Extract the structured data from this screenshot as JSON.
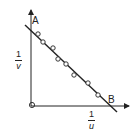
{
  "chart_data": {
    "type": "scatter",
    "title": "",
    "xlabel": "1/u",
    "ylabel": "1/v",
    "points_label_intercepts": {
      "y_intercept": "A",
      "x_intercept": "B"
    },
    "origin_marker": "O",
    "points_px": [
      [
        38,
        34
      ],
      [
        43,
        42
      ],
      [
        53,
        48
      ],
      [
        58,
        59
      ],
      [
        66,
        64
      ],
      [
        74,
        75
      ],
      [
        88,
        83
      ],
      [
        98,
        95
      ]
    ],
    "fit_line_px": [
      [
        25,
        25
      ],
      [
        117,
        112
      ]
    ],
    "grid": false
  },
  "labels": {
    "point_a": "A",
    "point_b": "B",
    "y_axis": {
      "num": "1",
      "den": "v"
    },
    "x_axis": {
      "num": "1",
      "den": "u"
    }
  },
  "colors": {
    "ink": "#222222",
    "background": "#ffffff"
  }
}
